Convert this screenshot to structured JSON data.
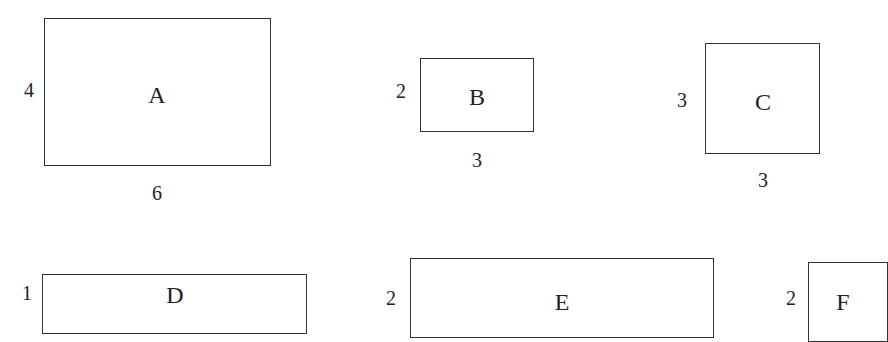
{
  "shapes": [
    {
      "id": "A",
      "label": "A",
      "height_label": "4",
      "width_label": "6"
    },
    {
      "id": "B",
      "label": "B",
      "height_label": "2",
      "width_label": "3"
    },
    {
      "id": "C",
      "label": "C",
      "height_label": "3",
      "width_label": "3"
    },
    {
      "id": "D",
      "label": "D",
      "height_label": "1"
    },
    {
      "id": "E",
      "label": "E",
      "height_label": "2"
    },
    {
      "id": "F",
      "label": "F",
      "height_label": "2"
    }
  ]
}
